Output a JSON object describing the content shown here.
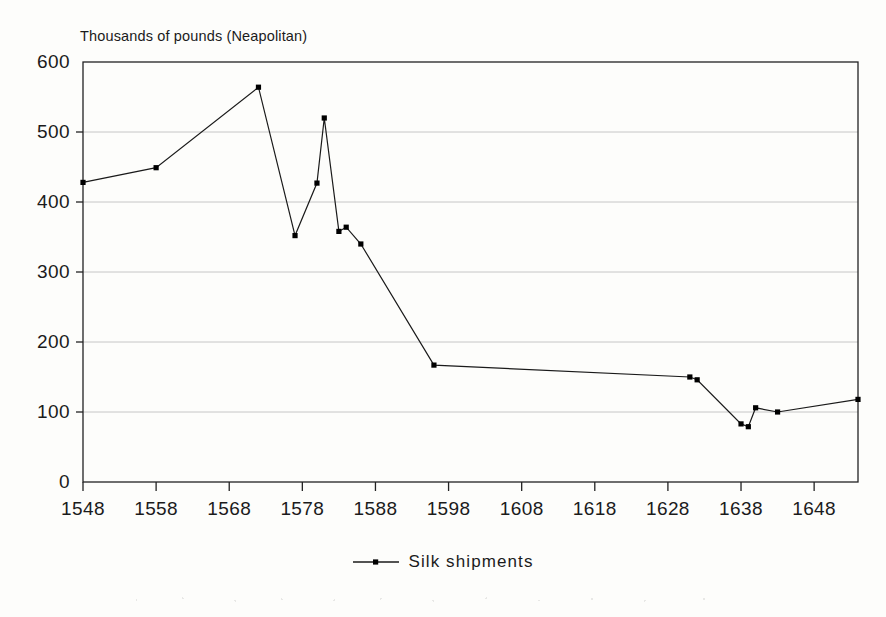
{
  "title": "",
  "axis_caption": "Thousands of pounds (Neapolitan)",
  "legend": {
    "marker_name": "line-with-square-marker",
    "label": "Silk shipments"
  },
  "colors": {
    "line": "#1a1a1a",
    "marker": "#000000",
    "grid": "#bfbfbf",
    "axis": "#222222",
    "background": "#fdfdfb",
    "text": "#1b1b1b"
  },
  "plot_box": {
    "left": 83,
    "right": 858,
    "top": 62,
    "bottom": 482
  },
  "chart_data": {
    "type": "line",
    "title": "",
    "xlabel": "",
    "ylabel": "Thousands of pounds (Neapolitan)",
    "xlim": [
      1548,
      1654
    ],
    "ylim": [
      0,
      600
    ],
    "ytick_step": 100,
    "xtick_step": 10,
    "yticks": [
      0,
      100,
      200,
      300,
      400,
      500,
      600
    ],
    "ytick_labels": [
      "0",
      "100",
      "200",
      "300",
      "400",
      "500",
      "600"
    ],
    "xticks": [
      1548,
      1558,
      1568,
      1578,
      1588,
      1598,
      1608,
      1618,
      1628,
      1638,
      1648
    ],
    "xtick_labels": [
      "1548",
      "1558",
      "1568",
      "1578",
      "1588",
      "1598",
      "1608",
      "1618",
      "1628",
      "1638",
      "1648"
    ],
    "grid": "horizontal",
    "legend_position": "bottom-center",
    "markers": "square",
    "series": [
      {
        "name": "Silk shipments",
        "x": [
          1548,
          1558,
          1572,
          1577,
          1580,
          1581,
          1583,
          1584,
          1586,
          1596,
          1631,
          1632,
          1638,
          1639,
          1640,
          1643,
          1654
        ],
        "values": [
          428,
          449,
          564,
          352,
          427,
          520,
          358,
          364,
          340,
          167,
          150,
          146,
          83,
          79,
          106,
          100,
          118
        ]
      }
    ]
  }
}
